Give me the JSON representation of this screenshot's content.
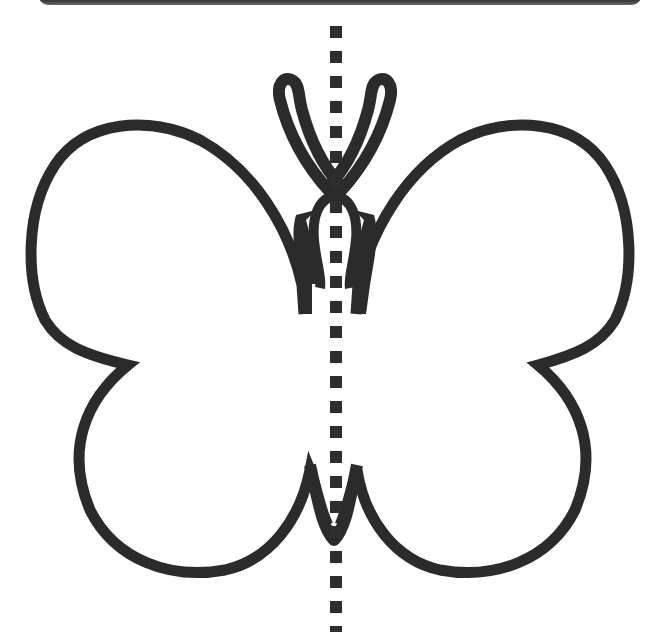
{
  "figure": {
    "subject": "butterfly outline",
    "purpose": "line of symmetry",
    "description": "Butterfly outline with a vertical dashed line of symmetry"
  },
  "colors": {
    "outline": "#2b2b2b",
    "symmetry_line": "#2e2e2e",
    "top_bar": "#444444",
    "background": "#ffffff"
  },
  "symmetry_line": {
    "x": 336,
    "dash_size": 12,
    "dash_period": 25,
    "orientation": "vertical"
  }
}
